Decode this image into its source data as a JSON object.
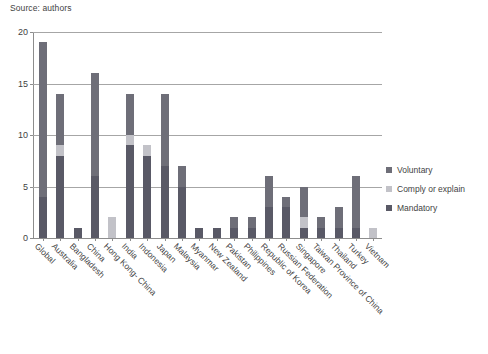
{
  "source_note": "Source: authors",
  "legend": {
    "position": "right",
    "entries": [
      {
        "label": "Voluntary",
        "color": "#6e6e78"
      },
      {
        "label": "Comply or explain",
        "color": "#c2c2c8"
      },
      {
        "label": "Mandatory",
        "color": "#595966"
      }
    ]
  },
  "axis": {
    "y_ticks": [
      "0",
      "5",
      "10",
      "15",
      "20"
    ],
    "y_values": [
      0,
      5,
      10,
      15,
      20
    ]
  },
  "chart_data": {
    "type": "bar",
    "title": "",
    "subtitle": "",
    "xlabel": "",
    "ylabel": "",
    "ylim": [
      0,
      20
    ],
    "ytick_step": 5,
    "grid": true,
    "stacked": true,
    "legend_position": "right",
    "annotations": [
      "Source: authors"
    ],
    "categories": [
      "Global",
      "Australia",
      "Bangladesh",
      "China",
      "Hong Kong- China",
      "India",
      "Indonesia",
      "Japan",
      "Malaysia",
      "Myanmar",
      "New Zealand",
      "Pakistan",
      "Philippines",
      "Republic of Korea",
      "Russian Federation",
      "Singapore",
      "Taiwan Province of China",
      "Thailand",
      "Turkey",
      "Vietnam"
    ],
    "series": [
      {
        "name": "Mandatory",
        "color": "#595966",
        "values": [
          4,
          8,
          1,
          6,
          0,
          9,
          8,
          7,
          5,
          1,
          1,
          1,
          1,
          3,
          3,
          1,
          1,
          1,
          1,
          0
        ]
      },
      {
        "name": "Comply or explain",
        "color": "#c2c2c8",
        "values": [
          0,
          1,
          0,
          0,
          2,
          1,
          1,
          0,
          0,
          0,
          0,
          0,
          0,
          0,
          0,
          1,
          0,
          0,
          0,
          1
        ]
      },
      {
        "name": "Voluntary",
        "color": "#6e6e78",
        "values": [
          15,
          5,
          0,
          10,
          0,
          4,
          0,
          7,
          2,
          0,
          0,
          1,
          1,
          3,
          1,
          3,
          1,
          2,
          5,
          0
        ]
      }
    ],
    "totals": [
      19,
      14,
      1,
      16,
      2,
      14,
      9,
      14,
      7,
      1,
      1,
      2,
      2,
      6,
      4,
      5,
      2,
      3,
      6,
      1
    ]
  }
}
